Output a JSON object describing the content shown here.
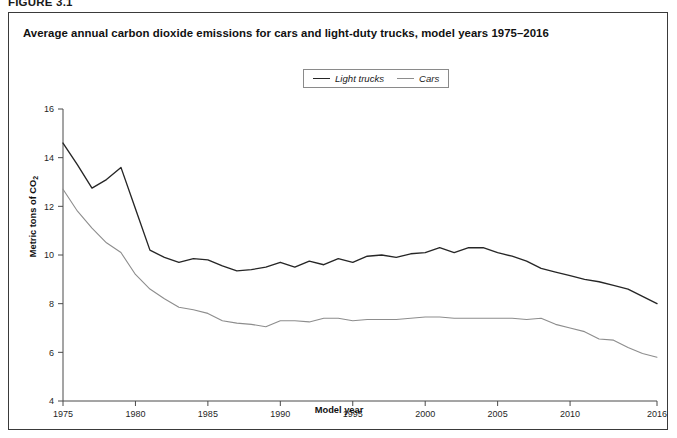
{
  "figure": {
    "number": "FIGURE 3.1",
    "title": "Average annual carbon dioxide emissions for cars and light-duty trucks, model years 1975–2016"
  },
  "legend": {
    "position": "top-center",
    "entries": [
      {
        "label": "Light trucks",
        "color": "#262626",
        "icon": "line-swatch-icon"
      },
      {
        "label": "Cars",
        "color": "#8d8d8d",
        "icon": "line-swatch-icon"
      }
    ]
  },
  "axes": {
    "y_label_text": "Metric tons of CO",
    "y_label_sub": "2",
    "x_label": "Model year"
  },
  "chart_data": {
    "type": "line",
    "title": "Average annual carbon dioxide emissions for cars and light-duty trucks, model years 1975–2016",
    "xlabel": "Model year",
    "ylabel": "Metric tons of CO2",
    "xlim": [
      1975,
      2016
    ],
    "ylim": [
      4,
      16
    ],
    "yticks": [
      4,
      6,
      8,
      10,
      12,
      14,
      16
    ],
    "xticks": [
      1975,
      1980,
      1985,
      1990,
      1995,
      2000,
      2005,
      2010,
      2016
    ],
    "grid": false,
    "legend_position": "top-center",
    "x": [
      1975,
      1976,
      1977,
      1978,
      1979,
      1980,
      1981,
      1982,
      1983,
      1984,
      1985,
      1986,
      1987,
      1988,
      1989,
      1990,
      1991,
      1992,
      1993,
      1994,
      1995,
      1996,
      1997,
      1998,
      1999,
      2000,
      2001,
      2002,
      2003,
      2004,
      2005,
      2006,
      2007,
      2008,
      2009,
      2010,
      2011,
      2012,
      2013,
      2014,
      2015,
      2016
    ],
    "series": [
      {
        "name": "Light trucks",
        "color": "#262626",
        "values": [
          14.6,
          13.7,
          12.75,
          13.1,
          13.6,
          11.9,
          10.2,
          9.9,
          9.7,
          9.85,
          9.8,
          9.55,
          9.35,
          9.4,
          9.5,
          9.7,
          9.5,
          9.75,
          9.6,
          9.85,
          9.7,
          9.95,
          10.0,
          9.9,
          10.05,
          10.1,
          10.3,
          10.1,
          10.3,
          10.3,
          10.1,
          9.95,
          9.75,
          9.45,
          9.3,
          9.15,
          9.0,
          8.9,
          8.75,
          8.6,
          8.3,
          8.0
        ]
      },
      {
        "name": "Cars",
        "color": "#8d8d8d",
        "values": [
          12.7,
          11.8,
          11.1,
          10.5,
          10.1,
          9.2,
          8.6,
          8.2,
          7.85,
          7.75,
          7.6,
          7.3,
          7.2,
          7.15,
          7.05,
          7.3,
          7.3,
          7.25,
          7.4,
          7.4,
          7.3,
          7.35,
          7.35,
          7.35,
          7.4,
          7.45,
          7.45,
          7.4,
          7.4,
          7.4,
          7.4,
          7.4,
          7.35,
          7.4,
          7.15,
          7.0,
          6.85,
          6.55,
          6.5,
          6.2,
          5.95,
          5.8
        ]
      }
    ]
  }
}
